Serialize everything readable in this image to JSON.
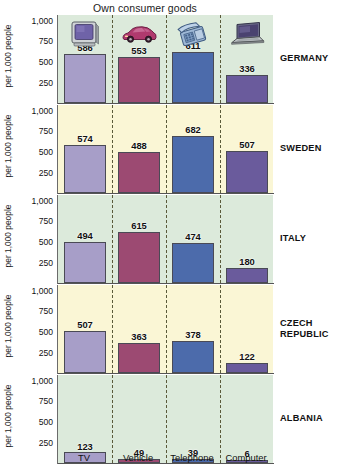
{
  "chart_data": {
    "type": "bar",
    "title": "Own consumer goods",
    "xlabel": "",
    "ylabel": "per 1,000 people",
    "ylim": [
      0,
      1000
    ],
    "yticks": [
      "1,000",
      "750",
      "500",
      "250"
    ],
    "grid": false,
    "legend": "none",
    "categories": [
      "TV",
      "Vehicle",
      "Telephone",
      "Computer"
    ],
    "category_icons": [
      "tv-icon",
      "car-icon",
      "telephone-icon",
      "laptop-icon"
    ],
    "series": [
      {
        "name": "GERMANY",
        "values": [
          586,
          553,
          611,
          336
        ]
      },
      {
        "name": "SWEDEN",
        "values": [
          574,
          488,
          682,
          507
        ]
      },
      {
        "name": "ITALY",
        "values": [
          494,
          615,
          474,
          180
        ]
      },
      {
        "name": "CZECH REPUBLIC",
        "values": [
          507,
          363,
          378,
          122
        ]
      },
      {
        "name": "ALBANIA",
        "values": [
          123,
          49,
          39,
          6
        ]
      }
    ],
    "panel_backgrounds": [
      "#dceadb",
      "#faf6d5",
      "#dceadb",
      "#faf6d5",
      "#dceadb"
    ],
    "bar_colors": [
      "#a79ec8",
      "#9c4a72",
      "#4c6bab",
      "#6a5b9c"
    ]
  },
  "panels": [
    {
      "country": "GERMANY",
      "country_lines": [
        "GERMANY"
      ],
      "bg": "#dceadb",
      "values": [
        586,
        553,
        611,
        336
      ]
    },
    {
      "country": "SWEDEN",
      "country_lines": [
        "SWEDEN"
      ],
      "bg": "#faf6d5",
      "values": [
        574,
        488,
        682,
        507
      ]
    },
    {
      "country": "ITALY",
      "country_lines": [
        "ITALY"
      ],
      "bg": "#dceadb",
      "values": [
        494,
        615,
        474,
        180
      ]
    },
    {
      "country": "CZECH REPUBLIC",
      "country_lines": [
        "CZECH",
        "REPUBLIC"
      ],
      "bg": "#faf6d5",
      "values": [
        507,
        363,
        378,
        122
      ]
    },
    {
      "country": "ALBANIA",
      "country_lines": [
        "ALBANIA"
      ],
      "bg": "#dceadb",
      "values": [
        123,
        49,
        39,
        6
      ]
    }
  ],
  "axis": {
    "y_title": "per 1,000 people",
    "ticks": [
      "1,000",
      "750",
      "500",
      "250"
    ]
  },
  "categories": {
    "labels": [
      "TV",
      "Vehicle",
      "Telephone",
      "Computer"
    ]
  },
  "values_text": {
    "germany": [
      "586",
      "553",
      "611",
      "336"
    ],
    "sweden": [
      "574",
      "488",
      "682",
      "507"
    ],
    "italy": [
      "494",
      "615",
      "474",
      "180"
    ],
    "czech": [
      "507",
      "363",
      "378",
      "122"
    ],
    "albania": [
      "123",
      "49",
      "39",
      "6"
    ]
  }
}
